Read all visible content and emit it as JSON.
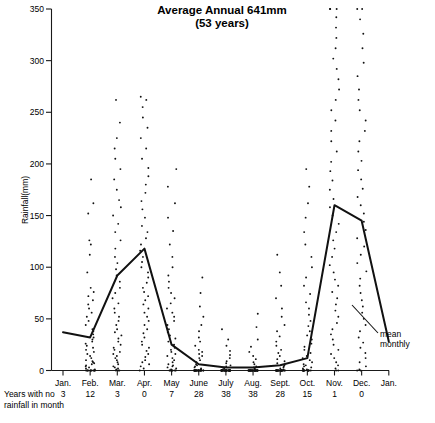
{
  "chart_data": {
    "type": "scatter",
    "title": "Average Annual 641mm",
    "subtitle": "(53 years)",
    "xlabel": "",
    "ylabel": "Rainfall(mm)",
    "ylim": [
      0,
      350
    ],
    "yticks": [
      0,
      50,
      100,
      150,
      200,
      250,
      300,
      350
    ],
    "grid": false,
    "legend_position": "inline-annotation",
    "categories": [
      "Jan.",
      "Feb.",
      "Mar.",
      "Apr.",
      "May",
      "June",
      "July",
      "Aug.",
      "Sept.",
      "Oct.",
      "Nov.",
      "Dec.",
      "Jan."
    ],
    "series": [
      {
        "name": "mean monthly",
        "type": "line",
        "values": [
          37,
          32,
          92,
          118,
          25,
          6,
          3,
          3,
          5,
          12,
          160,
          145,
          28
        ]
      }
    ],
    "annotations": [
      {
        "text": "mean",
        "x_category": "Jan.",
        "note": "label at end of mean monthly line"
      },
      {
        "text": "monthly",
        "x_category": "Jan.",
        "note": "second line of label"
      }
    ],
    "footer_label": "Years with no\nrainfall in month",
    "footer_label_line1": "Years with no",
    "footer_label_line2": "rainfall in month",
    "footer_values": [
      3,
      12,
      3,
      0,
      7,
      28,
      38,
      38,
      28,
      15,
      1,
      0
    ],
    "scatter_points": {
      "Jan.": [],
      "Feb.": [
        0,
        0,
        0,
        0,
        0,
        0,
        0,
        0,
        0,
        0,
        0,
        0,
        1,
        2,
        3,
        4,
        5,
        6,
        7,
        8,
        9,
        10,
        12,
        14,
        16,
        18,
        20,
        22,
        24,
        26,
        28,
        30,
        32,
        35,
        38,
        40,
        44,
        48,
        52,
        56,
        60,
        64,
        68,
        72,
        76,
        80,
        95,
        112,
        122,
        126,
        152,
        162,
        185
      ],
      "Mar.": [
        0,
        0,
        0,
        1,
        2,
        3,
        4,
        6,
        8,
        10,
        12,
        14,
        16,
        18,
        20,
        22,
        25,
        28,
        31,
        34,
        37,
        40,
        44,
        48,
        52,
        56,
        60,
        65,
        70,
        75,
        80,
        86,
        92,
        98,
        104,
        110,
        118,
        126,
        134,
        142,
        150,
        158,
        165,
        175,
        185,
        195,
        205,
        215,
        225,
        240,
        262
      ],
      "Apr.": [
        0,
        2,
        4,
        6,
        8,
        10,
        13,
        16,
        19,
        22,
        25,
        28,
        32,
        36,
        40,
        44,
        48,
        52,
        56,
        60,
        64,
        68,
        72,
        76,
        80,
        85,
        90,
        95,
        100,
        105,
        110,
        116,
        122,
        128,
        134,
        140,
        148,
        156,
        164,
        172,
        180,
        188,
        196,
        205,
        215,
        225,
        235,
        245,
        255,
        262,
        265
      ],
      "May": [
        0,
        0,
        0,
        0,
        0,
        0,
        0,
        1,
        2,
        3,
        4,
        5,
        6,
        8,
        10,
        12,
        14,
        16,
        18,
        20,
        22,
        25,
        28,
        31,
        34,
        37,
        40,
        44,
        48,
        52,
        56,
        60,
        65,
        70,
        75,
        80,
        86,
        92,
        100,
        110,
        122,
        135,
        148,
        162,
        178,
        195
      ],
      "June": [
        0,
        0,
        0,
        0,
        0,
        0,
        0,
        0,
        0,
        0,
        0,
        0,
        0,
        0,
        0,
        0,
        0,
        0,
        0,
        0,
        0,
        0,
        0,
        0,
        0,
        0,
        0,
        0,
        1,
        2,
        3,
        4,
        5,
        6,
        8,
        10,
        12,
        14,
        16,
        18,
        20,
        24,
        28,
        32,
        38,
        44,
        52,
        62,
        75,
        90
      ],
      "July": [
        0,
        0,
        0,
        0,
        0,
        0,
        0,
        0,
        0,
        0,
        0,
        0,
        0,
        0,
        0,
        0,
        0,
        0,
        0,
        0,
        0,
        0,
        0,
        0,
        0,
        0,
        0,
        0,
        0,
        0,
        0,
        0,
        0,
        0,
        0,
        0,
        0,
        0,
        1,
        2,
        3,
        4,
        5,
        7,
        9,
        12,
        15,
        19,
        24,
        30,
        40
      ],
      "Aug.": [
        0,
        0,
        0,
        0,
        0,
        0,
        0,
        0,
        0,
        0,
        0,
        0,
        0,
        0,
        0,
        0,
        0,
        0,
        0,
        0,
        0,
        0,
        0,
        0,
        0,
        0,
        0,
        0,
        0,
        0,
        0,
        0,
        0,
        0,
        0,
        0,
        0,
        0,
        1,
        2,
        3,
        4,
        6,
        8,
        11,
        14,
        18,
        23,
        30,
        42,
        55
      ],
      "Sept.": [
        0,
        0,
        0,
        0,
        0,
        0,
        0,
        0,
        0,
        0,
        0,
        0,
        0,
        0,
        0,
        0,
        0,
        0,
        0,
        0,
        0,
        0,
        0,
        0,
        0,
        0,
        0,
        0,
        1,
        2,
        3,
        4,
        5,
        7,
        9,
        11,
        14,
        17,
        20,
        24,
        28,
        33,
        38,
        44,
        52,
        60,
        70,
        82,
        95,
        112
      ],
      "Oct.": [
        0,
        0,
        0,
        0,
        0,
        0,
        0,
        0,
        0,
        0,
        0,
        0,
        0,
        0,
        0,
        1,
        2,
        3,
        4,
        5,
        6,
        8,
        10,
        12,
        14,
        17,
        20,
        23,
        26,
        30,
        34,
        38,
        43,
        48,
        54,
        60,
        66,
        74,
        82,
        90,
        100,
        110,
        122,
        134,
        148,
        162,
        178,
        195
      ],
      "Nov.": [
        0,
        0,
        2,
        5,
        8,
        12,
        16,
        20,
        25,
        30,
        35,
        40,
        46,
        52,
        58,
        64,
        70,
        76,
        82,
        88,
        95,
        102,
        110,
        118,
        126,
        134,
        142,
        150,
        158,
        166,
        175,
        184,
        193,
        202,
        212,
        222,
        232,
        242,
        252,
        262,
        272,
        282,
        292,
        302,
        312,
        322,
        332,
        342,
        350,
        350,
        350
      ],
      "Dec.": [
        0,
        0,
        1,
        4,
        8,
        12,
        17,
        22,
        27,
        32,
        38,
        44,
        50,
        56,
        62,
        68,
        75,
        82,
        89,
        96,
        104,
        112,
        120,
        128,
        136,
        144,
        152,
        160,
        168,
        176,
        185,
        194,
        203,
        212,
        222,
        232,
        242,
        252,
        262,
        272,
        285,
        298,
        312,
        326,
        340,
        350,
        350
      ]
    }
  }
}
